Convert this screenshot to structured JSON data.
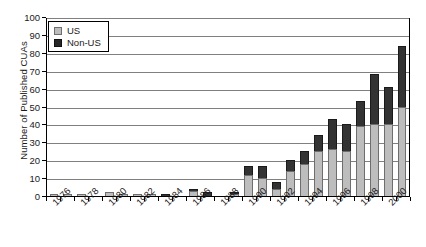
{
  "chart_data": {
    "type": "bar",
    "stacked": true,
    "title": "",
    "subtitle": "",
    "xlabel": "",
    "ylabel": "Number of Published CUAs",
    "ylim": [
      0,
      100
    ],
    "ytick_step": 10,
    "yticks": [
      0,
      10,
      20,
      30,
      40,
      50,
      60,
      70,
      80,
      90,
      100
    ],
    "ytick_labels": [
      "0",
      "10",
      "20",
      "30",
      "40",
      "50",
      "60",
      "70",
      "80",
      "90",
      "100"
    ],
    "grid": "horizontal",
    "legend_position": "top-left",
    "legend": [
      "US",
      "Non-US"
    ],
    "categories": [
      "1976",
      "1977",
      "1978",
      "1979",
      "1980",
      "1981",
      "1982",
      "1983",
      "1984",
      "1985",
      "1986",
      "1987",
      "1988",
      "1989",
      "1990",
      "1991",
      "1992",
      "1993",
      "1994",
      "1995",
      "1996",
      "1997",
      "1998",
      "1999",
      "2000",
      "2001"
    ],
    "xtick_labels_shown": [
      "1976",
      "1978",
      "1980",
      "1982",
      "1984",
      "1986",
      "1988",
      "1990",
      "1992",
      "1994",
      "1996",
      "1998",
      "2000"
    ],
    "series": [
      {
        "name": "US",
        "color": "#bdbdbd",
        "values": [
          1,
          1,
          1,
          0,
          2,
          1,
          1,
          1,
          0,
          0,
          3,
          0,
          0,
          1,
          12,
          10,
          4,
          14,
          18,
          25,
          26,
          25,
          39,
          40,
          40,
          50
        ]
      },
      {
        "name": "Non-US",
        "color": "#333333",
        "values": [
          0,
          0,
          0,
          0,
          0,
          0,
          0,
          0,
          1,
          0,
          1,
          2,
          0,
          1,
          5,
          7,
          4,
          6,
          7,
          9,
          17,
          15,
          14,
          28,
          21,
          34
        ]
      }
    ],
    "totals": [
      1,
      1,
      1,
      0,
      2,
      1,
      1,
      1,
      1,
      0,
      4,
      2,
      0,
      2,
      17,
      17,
      8,
      20,
      25,
      34,
      43,
      40,
      53,
      68,
      61,
      84
    ]
  }
}
